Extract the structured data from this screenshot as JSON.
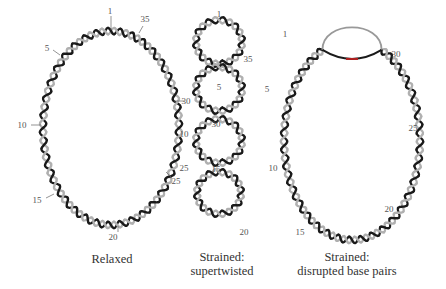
{
  "panels": [
    {
      "id": "relaxed",
      "caption_lines": [
        "Relaxed"
      ],
      "labels": [
        {
          "text": "1",
          "x": 110,
          "y": 14,
          "lx1": 111,
          "ly1": 16,
          "lx2": 111,
          "ly2": 30
        },
        {
          "text": "35",
          "x": 145,
          "y": 22,
          "lx1": 143,
          "ly1": 26,
          "lx2": 139,
          "ly2": 33
        },
        {
          "text": "5",
          "x": 47,
          "y": 51,
          "lx1": 53,
          "ly1": 50,
          "lx2": 60,
          "ly2": 55
        },
        {
          "text": "30",
          "x": 186,
          "y": 104,
          "lx1": 174,
          "ly1": 101,
          "lx2": 184,
          "ly2": 101
        },
        {
          "text": "10",
          "x": 22,
          "y": 128,
          "lx1": 31,
          "ly1": 125,
          "lx2": 41,
          "ly2": 125
        },
        {
          "text": "25",
          "x": 176,
          "y": 184,
          "lx1": 172,
          "ly1": 178,
          "lx2": 166,
          "ly2": 172
        },
        {
          "text": "15",
          "x": 37,
          "y": 203,
          "lx1": 46,
          "ly1": 198,
          "lx2": 54,
          "ly2": 194
        },
        {
          "text": "20",
          "x": 113,
          "y": 240,
          "lx1": 118,
          "ly1": 226,
          "lx2": 118,
          "ly2": 232
        }
      ]
    },
    {
      "id": "supertwisted",
      "caption_lines": [
        "Strained:",
        "supertwisted"
      ],
      "labels": [
        {
          "text": "1",
          "x": 219,
          "y": 17
        },
        {
          "text": "35",
          "x": 248,
          "y": 62
        },
        {
          "text": "5",
          "x": 219,
          "y": 90
        },
        {
          "text": "30",
          "x": 216,
          "y": 127
        },
        {
          "text": "10",
          "x": 184,
          "y": 137
        },
        {
          "text": "25",
          "x": 184,
          "y": 171
        },
        {
          "text": "15",
          "x": 216,
          "y": 172
        },
        {
          "text": "20",
          "x": 244,
          "y": 235
        }
      ]
    },
    {
      "id": "disrupted",
      "caption_lines": [
        "Strained:",
        "disrupted base pairs"
      ],
      "labels": [
        {
          "text": "1",
          "x": 285,
          "y": 37
        },
        {
          "text": "30",
          "x": 396,
          "y": 57
        },
        {
          "text": "5",
          "x": 267,
          "y": 92
        },
        {
          "text": "25",
          "x": 413,
          "y": 131
        },
        {
          "text": "10",
          "x": 273,
          "y": 171
        },
        {
          "text": "20",
          "x": 389,
          "y": 212
        },
        {
          "text": "15",
          "x": 300,
          "y": 235
        }
      ]
    }
  ],
  "colors": {
    "strand_dark": "#1a1a1a",
    "strand_light": "#b0b0b0",
    "open_loop": "#999999",
    "disrupted_accent": "#b02020"
  }
}
